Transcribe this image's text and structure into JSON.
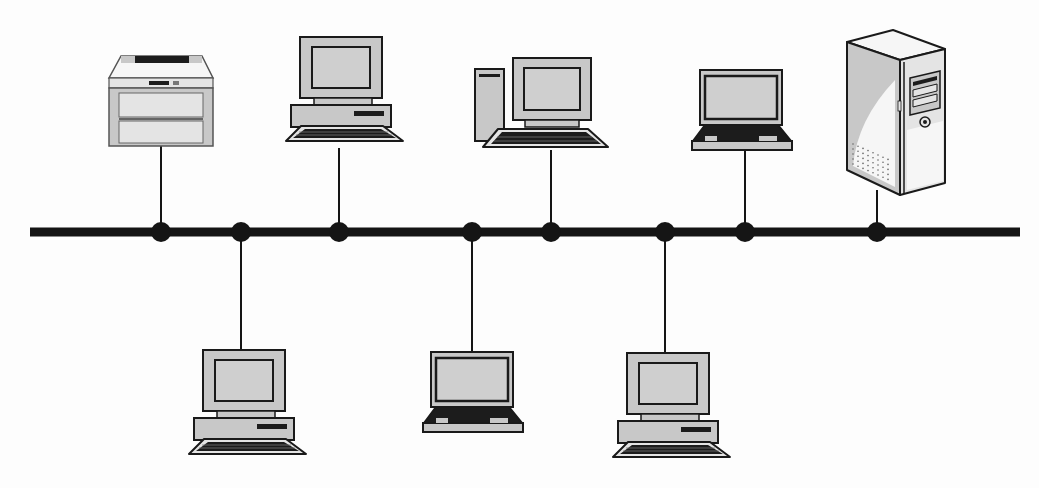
{
  "diagram": {
    "type": "bus-topology",
    "title": "",
    "colors": {
      "background": "#fdfdfd",
      "bus": "#151515",
      "outline": "#1a1a1a",
      "fill": "#c8c8c8",
      "fill_light": "#e4e4e4",
      "screen": "#cfcfcf",
      "dark": "#1c1c1c",
      "white": "#f6f6f6"
    },
    "bus": {
      "x1": 30,
      "x2": 1020,
      "y": 232,
      "thickness": 9
    },
    "nodes": [
      {
        "id": "printer",
        "device": "printer",
        "tap_x": 161,
        "side": "top",
        "device_bottom": 146
      },
      {
        "id": "pc-bottom-1",
        "device": "desktop-computer",
        "tap_x": 241,
        "side": "bottom",
        "device_top": 350
      },
      {
        "id": "pc-top-1",
        "device": "desktop-computer",
        "tap_x": 339,
        "side": "top",
        "device_bottom": 148
      },
      {
        "id": "laptop-bottom-1",
        "device": "laptop",
        "tap_x": 472,
        "side": "bottom",
        "device_top": 352
      },
      {
        "id": "tower-pc-top",
        "device": "tower-computer",
        "tap_x": 551,
        "side": "top",
        "device_bottom": 150
      },
      {
        "id": "pc-bottom-2",
        "device": "desktop-computer",
        "tap_x": 665,
        "side": "bottom",
        "device_top": 353
      },
      {
        "id": "laptop-top-1",
        "device": "laptop",
        "tap_x": 745,
        "side": "top",
        "device_bottom": 150
      },
      {
        "id": "server",
        "device": "server-tower",
        "tap_x": 877,
        "side": "top",
        "device_bottom": 190
      }
    ]
  }
}
